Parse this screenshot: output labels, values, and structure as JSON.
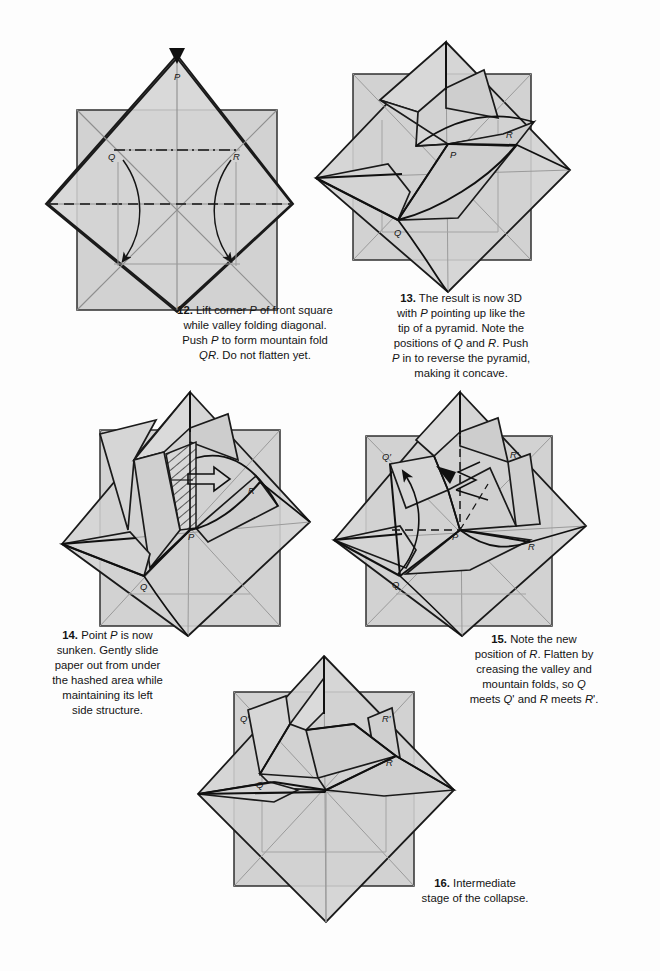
{
  "document": {
    "type": "origami-instruction-page",
    "page_background": "#fdfdfd",
    "paper_fill": "#d2d2d2",
    "paper_fill_light": "#dcdcdc",
    "paper_fill_dark": "#c2c2c2",
    "line_color": "#1a1a1a",
    "crease_color": "#8a8a8a"
  },
  "steps": [
    {
      "number": "12.",
      "text_lines": [
        "Lift corner P of front square",
        "while valley folding diagonal.",
        "Push P to form mountain fold",
        "QR.  Do not flatten yet."
      ],
      "labels": [
        "P",
        "Q",
        "R"
      ],
      "markers": {
        "push_arrowhead": true,
        "valley_fold_dashes": 2,
        "mountain_fold_dashdot": 1,
        "rotate_arrows": 2
      }
    },
    {
      "number": "13.",
      "text_lines": [
        "The result is now 3D",
        "with P pointing up like the",
        "tip of a pyramid.  Note the",
        "positions of Q and R.  Push",
        "P in to reverse the pyramid,",
        "making it concave."
      ],
      "labels": [
        "P",
        "Q",
        "R"
      ],
      "markers": {}
    },
    {
      "number": "14.",
      "text_lines": [
        "Point P is now",
        "sunken.  Gently slide",
        "paper out from under",
        "the hashed area while",
        "maintaining its left",
        "side structure."
      ],
      "labels": [
        "P",
        "Q",
        "R"
      ],
      "markers": {
        "hatched_region": true,
        "hollow_arrow": true
      }
    },
    {
      "number": "15.",
      "text_lines": [
        "Note the new",
        "position of R. Flatten by",
        "creasing the valley and",
        "mountain folds, so Q",
        "meets Q' and R meets R'."
      ],
      "labels": [
        "P",
        "Q",
        "R",
        "Q′",
        "R′"
      ],
      "markers": {
        "valley_fold_dashes": 2,
        "fold_arrow": 1,
        "push_arrow": 1
      }
    },
    {
      "number": "16.",
      "text_lines": [
        "Intermediate",
        "stage of the collapse."
      ],
      "labels": [
        "Q",
        "R",
        "Q′",
        "R′"
      ],
      "markers": {}
    }
  ]
}
